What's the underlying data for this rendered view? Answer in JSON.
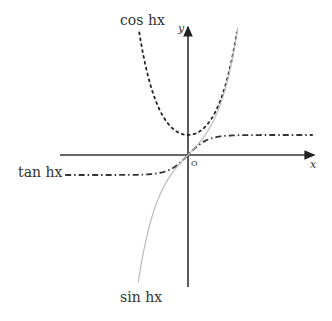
{
  "chart_data": {
    "type": "line",
    "title": "",
    "xlabel": "x",
    "ylabel": "y",
    "origin_label": "O",
    "xlim": [
      -6.4,
      6.4
    ],
    "ylim": [
      -6.6,
      6.5
    ],
    "grid": false,
    "series": [
      {
        "name": "cosh x",
        "label": "cos hx",
        "function": "cosh",
        "style": "dotted",
        "color": "#222222",
        "x_range": [
          -2.5,
          2.5
        ]
      },
      {
        "name": "tanh x",
        "label": "tan hx",
        "function": "tanh",
        "style": "dash-dot",
        "color": "#333333",
        "x_range": [
          -6.3,
          6.4
        ]
      },
      {
        "name": "sinh x",
        "label": "sin hx",
        "function": "sinh",
        "style": "solid",
        "color": "#bbbbbb",
        "x_range": [
          -2.55,
          2.55
        ]
      }
    ]
  }
}
